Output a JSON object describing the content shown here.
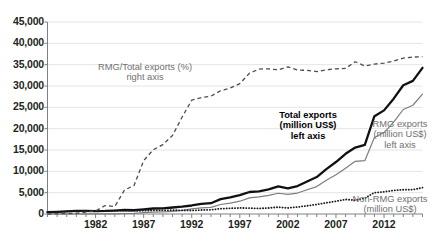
{
  "chart_data": {
    "type": "line",
    "title": "",
    "xlabel": "",
    "ylabel": "",
    "ylim": [
      0,
      45000
    ],
    "y2lim": [
      0,
      100
    ],
    "xlim": [
      1977,
      2016
    ],
    "grid": true,
    "legend_position": "inline-annotations",
    "y_ticks": [
      "0",
      "5,000",
      "10,000",
      "15,000",
      "20,000",
      "25,000",
      "30,000",
      "35,000",
      "40,000",
      "45,000"
    ],
    "y_tick_values": [
      0,
      5000,
      10000,
      15000,
      20000,
      25000,
      30000,
      35000,
      40000,
      45000
    ],
    "x_ticks": [
      "1982",
      "1987",
      "1992",
      "1997",
      "2002",
      "2007",
      "2012"
    ],
    "x_tick_values": [
      1982,
      1987,
      1992,
      1997,
      2002,
      2007,
      2012
    ],
    "x": [
      1977,
      1978,
      1979,
      1980,
      1981,
      1982,
      1983,
      1984,
      1985,
      1986,
      1987,
      1988,
      1989,
      1990,
      1991,
      1992,
      1993,
      1994,
      1995,
      1996,
      1997,
      1998,
      1999,
      2000,
      2001,
      2002,
      2003,
      2004,
      2005,
      2006,
      2007,
      2008,
      2009,
      2010,
      2011,
      2012,
      2013,
      2014,
      2015,
      2016
    ],
    "series": [
      {
        "name": "Total exports (million US$) left axis",
        "axis": "left",
        "style": "solid-thick-black",
        "color": "#111111",
        "values": [
          420,
          490,
          600,
          720,
          710,
          690,
          724,
          811,
          934,
          880,
          1074,
          1291,
          1306,
          1524,
          1718,
          1994,
          2383,
          2534,
          3473,
          3883,
          4418,
          5161,
          5324,
          5752,
          6467,
          5986,
          6548,
          7603,
          8655,
          10526,
          12178,
          14111,
          15565,
          16205,
          22924,
          24288,
          27027,
          30177,
          31209,
          34257
        ]
      },
      {
        "name": "RMG exports (million US$) left axis",
        "axis": "left",
        "style": "solid-thin-gray",
        "color": "#7d7d7d",
        "values": [
          0,
          0,
          1,
          3,
          7,
          11,
          32,
          32,
          116,
          131,
          299,
          433,
          471,
          624,
          867,
          1182,
          1445,
          1555,
          2228,
          2547,
          3001,
          3781,
          4020,
          4349,
          4860,
          4583,
          4912,
          5686,
          6418,
          7901,
          9211,
          10700,
          12348,
          12497,
          17914,
          19089,
          21515,
          24492,
          25491,
          28094
        ]
      },
      {
        "name": "Non-RMG exports (million US$)",
        "axis": "left",
        "style": "dotted-black",
        "color": "#1a1a1a",
        "values": [
          420,
          490,
          599,
          717,
          703,
          679,
          692,
          779,
          818,
          749,
          775,
          858,
          835,
          900,
          851,
          812,
          938,
          979,
          1245,
          1336,
          1417,
          1380,
          1304,
          1403,
          1607,
          1403,
          1636,
          1917,
          2237,
          2625,
          2967,
          3411,
          3217,
          3708,
          5010,
          5199,
          5512,
          5685,
          5718,
          6163
        ]
      },
      {
        "name": "RMG/Total exports (%) right axis",
        "axis": "right",
        "style": "dashed-gray",
        "color": "#4d4d4d",
        "values": [
          0.0,
          0.1,
          0.2,
          0.4,
          1.0,
          1.6,
          4.4,
          3.9,
          12.4,
          14.9,
          27.8,
          33.5,
          36.1,
          40.9,
          50.5,
          59.3,
          60.6,
          61.4,
          64.2,
          65.6,
          67.9,
          73.3,
          75.5,
          75.6,
          75.1,
          76.6,
          75.0,
          74.8,
          74.2,
          75.1,
          75.6,
          75.8,
          79.3,
          77.1,
          78.1,
          78.6,
          79.6,
          81.2,
          81.7,
          82.0
        ]
      }
    ],
    "annotations": [
      {
        "id": "rmg-share-label",
        "text": "RMG/Total exports (%)\nright axis",
        "color": "#6f6f6f",
        "weight": "normal",
        "x_px": 86,
        "y_px": 62,
        "width_px": 118
      },
      {
        "id": "total-exports-label",
        "text": "Total exports\n(million US$)\nleft axis",
        "color": "#000000",
        "weight": "bold",
        "x_px": 275,
        "y_px": 110,
        "width_px": 66
      },
      {
        "id": "rmg-exports-label",
        "text": "RMG  exports\n(million US$)\nleft axis",
        "color": "#6f6f6f",
        "weight": "normal",
        "x_px": 366,
        "y_px": 119,
        "width_px": 68
      },
      {
        "id": "non-rmg-exports-label",
        "text": "Non-RMG exports\n(million US$)",
        "color": "#6f6f6f",
        "weight": "normal",
        "x_px": 344,
        "y_px": 194,
        "width_px": 92
      }
    ]
  },
  "colors": {
    "axis": "#808080",
    "grid": "#e4e4e4",
    "background": "#ffffff",
    "total": "#111111",
    "rmg": "#7d7d7d",
    "non_rmg": "#1a1a1a",
    "share": "#4d4d4d"
  }
}
